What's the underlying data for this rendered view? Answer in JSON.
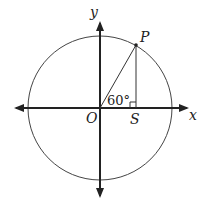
{
  "diagram": {
    "title": "",
    "type": "unit-circle-angle",
    "axes": {
      "x_label": "x",
      "y_label": "y"
    },
    "origin_label": "O",
    "point_label": "P",
    "foot_label": "S",
    "angle_label": "60°",
    "angle_degrees": 60,
    "right_angle_at": "S",
    "colors": {
      "stroke": "#222222",
      "background": "#ffffff"
    }
  }
}
